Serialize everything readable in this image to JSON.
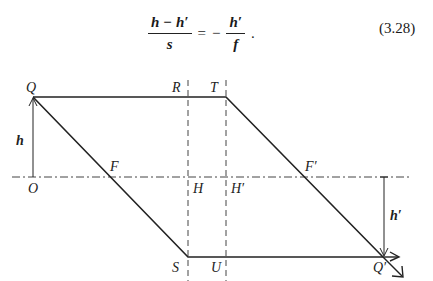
{
  "equation": {
    "lhs_numerator": "h − h′",
    "lhs_denominator": "s",
    "equals": "=",
    "minus": "−",
    "rhs_numerator": "h′",
    "rhs_denominator": "f",
    "period": ".",
    "number": "(3.28)"
  },
  "diagram": {
    "labels": {
      "Q": "Q",
      "R": "R",
      "T": "T",
      "h": "h",
      "O": "O",
      "F": "F",
      "H": "H",
      "H_prime": "H′",
      "F_prime": "F′",
      "h_prime": "h′",
      "S": "S",
      "U": "U",
      "Q_prime": "Q′"
    },
    "colors": {
      "ray": "#222222",
      "construction": "#444444"
    }
  }
}
